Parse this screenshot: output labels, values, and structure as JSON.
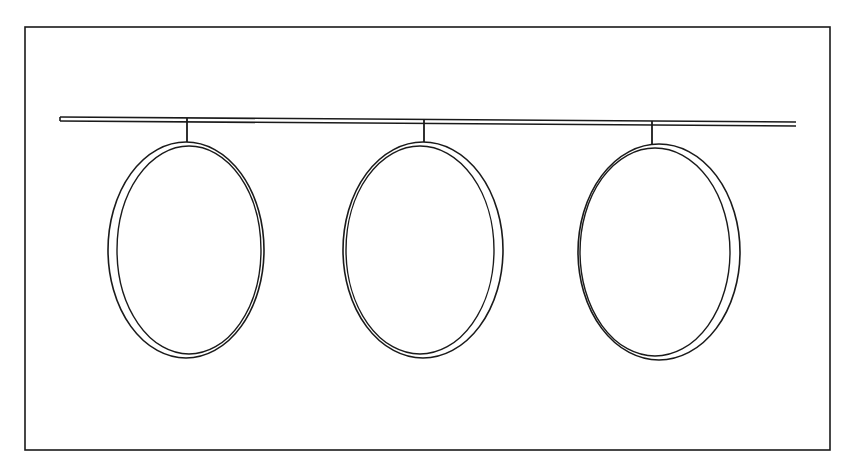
{
  "diagram": {
    "type": "line-drawing",
    "colors": {
      "background": "#ffffff",
      "line": "#1a1a1a"
    },
    "frame": {
      "x1": 25,
      "y1": 27,
      "x2": 830,
      "y2": 450
    },
    "rod": {
      "x1": 60,
      "y1": 117,
      "x2": 796,
      "y2": 122,
      "gap": 4
    },
    "rings": [
      {
        "id": "ring-1",
        "hanger_x": 187,
        "hanger_top": 118,
        "cx": 186,
        "cy": 250,
        "rx": 78,
        "ry": 108,
        "inner_rx": 72,
        "inner_ry": 104,
        "inner_dx": 3
      },
      {
        "id": "ring-2",
        "hanger_x": 424,
        "hanger_top": 119,
        "cx": 423,
        "cy": 250,
        "rx": 80,
        "ry": 108,
        "inner_rx": 74,
        "inner_ry": 104,
        "inner_dx": -3
      },
      {
        "id": "ring-3",
        "hanger_x": 652,
        "hanger_top": 121,
        "cx": 659,
        "cy": 252,
        "rx": 81,
        "ry": 108,
        "inner_rx": 75,
        "inner_ry": 104,
        "inner_dx": -4
      }
    ]
  }
}
